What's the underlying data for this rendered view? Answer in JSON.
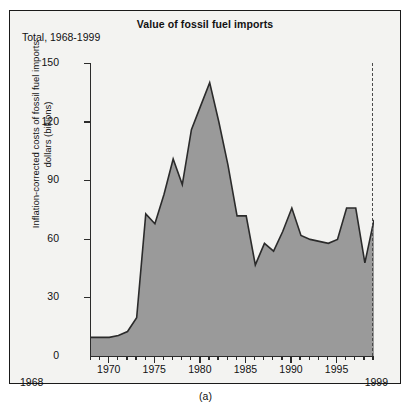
{
  "figure": {
    "title": "Value of fossil fuel imports",
    "total_label": "Total, 1968-1999",
    "caption": "(a)",
    "start_year_label": "1968",
    "end_year_label": "1999",
    "area_color": "#9a9a9a",
    "line_color": "#2b2b2b",
    "plot_background": "#f3f3f1",
    "frame_color": "#1a1a1a"
  },
  "chart_data": {
    "type": "area",
    "title": "Value of fossil fuel imports",
    "subtitle": "Total, 1968-1999",
    "xlabel": "",
    "ylabel": "Inflation-corrected costs of fossil fuel imports dollars (billions)",
    "ylabel_line1": "Inflation-corrected costs of fossil fuel imports",
    "ylabel_line2": "dollars (billions)",
    "xlim": [
      1968,
      1999
    ],
    "ylim": [
      0,
      150
    ],
    "yticks": [
      0,
      30,
      60,
      90,
      120,
      150
    ],
    "xticks_major": [
      1970,
      1975,
      1980,
      1985,
      1990,
      1995
    ],
    "xtick_labels_major": [
      "1970",
      "1975",
      "1980",
      "1985",
      "1990",
      "1995"
    ],
    "xticks_minor_step": 1,
    "grid": false,
    "legend": null,
    "x": [
      1968,
      1969,
      1970,
      1971,
      1972,
      1973,
      1974,
      1975,
      1976,
      1977,
      1978,
      1979,
      1980,
      1981,
      1982,
      1983,
      1984,
      1985,
      1986,
      1987,
      1988,
      1989,
      1990,
      1991,
      1992,
      1993,
      1994,
      1995,
      1996,
      1997,
      1998,
      1999
    ],
    "values": [
      10,
      10,
      10,
      11,
      13,
      20,
      73,
      68,
      83,
      101,
      88,
      116,
      128,
      140,
      120,
      98,
      72,
      72,
      47,
      58,
      54,
      64,
      76,
      62,
      60,
      59,
      58,
      60,
      76,
      76,
      48,
      70
    ],
    "series": [
      {
        "name": "Inflation-corrected cost of fossil fuel imports",
        "values": [
          10,
          10,
          10,
          11,
          13,
          20,
          73,
          68,
          83,
          101,
          88,
          116,
          128,
          140,
          120,
          98,
          72,
          72,
          47,
          58,
          54,
          64,
          76,
          62,
          60,
          59,
          58,
          60,
          76,
          76,
          48,
          70
        ]
      }
    ],
    "annotations": [
      {
        "text": "Peak",
        "x": 1981,
        "y": 140
      }
    ]
  },
  "axes": {
    "y_tick_labels": [
      "150",
      "120",
      "90",
      "60",
      "30",
      "0"
    ],
    "x_tick_labels": [
      "1970",
      "1975",
      "1980",
      "1985",
      "1990",
      "1995"
    ]
  }
}
